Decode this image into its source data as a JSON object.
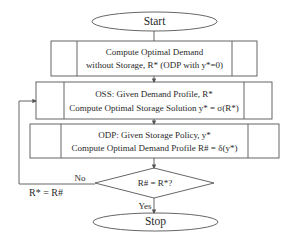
{
  "flowchart": {
    "start": {
      "label": "Start"
    },
    "step1": {
      "line1": "Compute Optimal Demand",
      "line2": "without Storage, R* (ODP with y*=0)"
    },
    "step2": {
      "line1": "OSS: Given Demand Profile, R*",
      "line2": "Compute Optimal Storage Solution y* = σ(R*)"
    },
    "step3": {
      "line1": "ODP: Given Storage Policy, y*",
      "line2": "Compute Optimal Demand Profile R# = δ(y*)"
    },
    "decision": {
      "label": "R# = R*?"
    },
    "no_label": "No",
    "yes_label": "Yes",
    "feedback_label": "R* = R#",
    "stop": {
      "label": "Stop"
    }
  },
  "colors": {
    "line": "#555555",
    "text": "#2a2a2a",
    "background": "#ffffff"
  }
}
